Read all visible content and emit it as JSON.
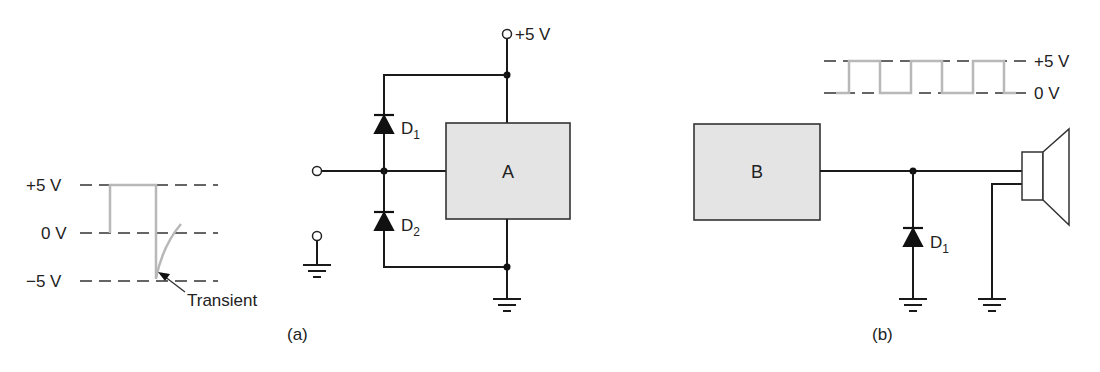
{
  "figure": {
    "panel_a": {
      "caption": "(a)",
      "waveform": {
        "levels": [
          "+5 V",
          "0 V",
          "−5 V"
        ],
        "annotation": "Transient"
      },
      "supply_label": "+5 V",
      "block_label": "A",
      "diodes": [
        {
          "name": "D",
          "sub": "1"
        },
        {
          "name": "D",
          "sub": "2"
        }
      ]
    },
    "panel_b": {
      "caption": "(b)",
      "waveform": {
        "levels": [
          "+5 V",
          "0 V"
        ],
        "pulses": 3
      },
      "block_label": "B",
      "diodes": [
        {
          "name": "D",
          "sub": "1"
        }
      ],
      "load": "speaker"
    },
    "colors": {
      "wire": "#1a1a1a",
      "waveform": "#b8b8b8",
      "block_fill": "#e4e4e4"
    }
  }
}
